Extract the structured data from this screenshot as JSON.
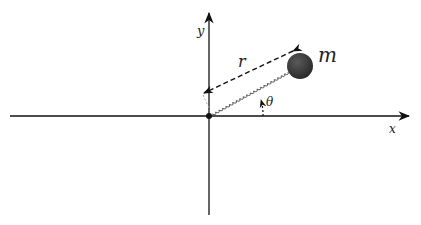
{
  "diagram": {
    "axes": {
      "x_label": "x",
      "y_label": "y"
    },
    "labels": {
      "radius": "r",
      "angle": "θ",
      "mass": "m"
    },
    "elements": [
      {
        "name": "x-axis",
        "type": "arrow"
      },
      {
        "name": "y-axis",
        "type": "arrow"
      },
      {
        "name": "origin",
        "type": "point"
      },
      {
        "name": "spring",
        "type": "coil"
      },
      {
        "name": "radius-vector",
        "type": "dashed-arrow"
      },
      {
        "name": "angle-arc",
        "type": "dotted-arc-arrow"
      },
      {
        "name": "mass",
        "type": "sphere"
      }
    ],
    "colors": {
      "axis": "#111111",
      "mass": "#3a3a3a",
      "spring": "#555555"
    }
  }
}
